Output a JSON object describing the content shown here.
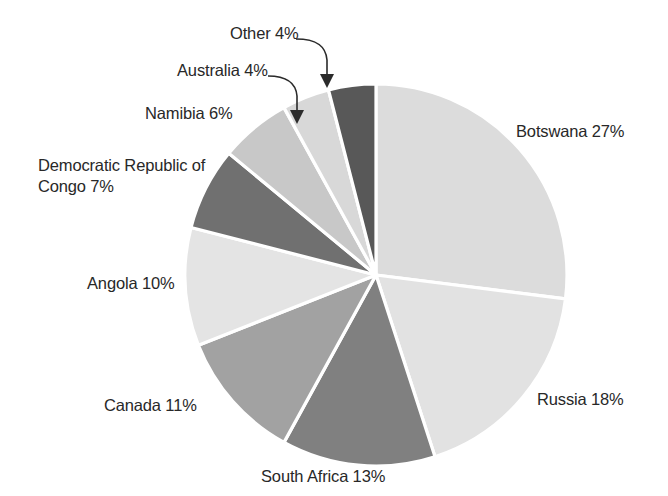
{
  "chart_data": {
    "type": "pie",
    "title": "",
    "unit": "%",
    "start_angle_deg": 0,
    "direction": "clockwise",
    "legend": "none",
    "labels_position": "outside",
    "categories": [
      "Botswana",
      "Russia",
      "South Africa",
      "Canada",
      "Angola",
      "Democratic Republic of Congo",
      "Namibia",
      "Australia",
      "Other"
    ],
    "values": [
      27,
      18,
      13,
      11,
      10,
      7,
      6,
      4,
      4
    ],
    "total": 100,
    "slice_colors": [
      "#dcdcdc",
      "#e2e2e2",
      "#808080",
      "#a2a2a2",
      "#e4e4e4",
      "#707070",
      "#c8c8c8",
      "#d8d8d8",
      "#585858"
    ],
    "separator_color": "#ffffff",
    "slices": [
      {
        "name": "Botswana",
        "value": 27,
        "label": "Botswana 27%",
        "color": "#dcdcdc"
      },
      {
        "name": "Russia",
        "value": 18,
        "label": "Russia 18%",
        "color": "#e2e2e2"
      },
      {
        "name": "South Africa",
        "value": 13,
        "label": "South Africa 13%",
        "color": "#808080"
      },
      {
        "name": "Canada",
        "value": 11,
        "label": "Canada 11%",
        "color": "#a2a2a2"
      },
      {
        "name": "Angola",
        "value": 10,
        "label": "Angola 10%",
        "color": "#e4e4e4"
      },
      {
        "name": "Democratic Republic of Congo",
        "value": 7,
        "label": "Democratic Republic of Congo 7%",
        "color": "#707070"
      },
      {
        "name": "Namibia",
        "value": 6,
        "label": "Namibia 6%",
        "color": "#c8c8c8"
      },
      {
        "name": "Australia",
        "value": 4,
        "label": "Australia 4%",
        "color": "#d8d8d8"
      },
      {
        "name": "Other",
        "value": 4,
        "label": "Other 4%",
        "color": "#585858"
      }
    ]
  },
  "labels": {
    "botswana": "Botswana 27%",
    "russia": "Russia 18%",
    "south_africa": "South Africa 13%",
    "canada": "Canada 11%",
    "angola": "Angola 10%",
    "drc": "Democratic Republic of Congo 7%",
    "namibia": "Namibia 6%",
    "australia": "Australia 4%",
    "other": "Other 4%"
  },
  "geometry": {
    "center_x": 376,
    "center_y": 275,
    "radius": 191
  }
}
